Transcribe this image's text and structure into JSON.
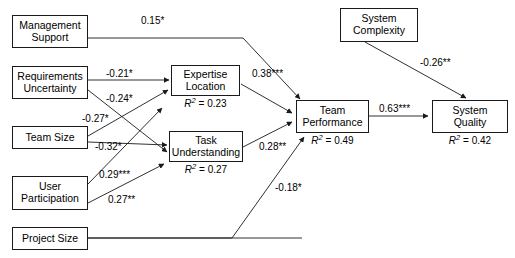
{
  "diagram": {
    "type": "path-diagram",
    "nodes": [
      {
        "id": "management_support",
        "label": "Management\nSupport",
        "r2": null
      },
      {
        "id": "requirements_uncertainty",
        "label": "Requirements\nUncertainty",
        "r2": null
      },
      {
        "id": "team_size",
        "label": "Team Size",
        "r2": null
      },
      {
        "id": "user_participation",
        "label": "User\nParticipation",
        "r2": null
      },
      {
        "id": "project_size",
        "label": "Project Size",
        "r2": null
      },
      {
        "id": "expertise_location",
        "label": "Expertise\nLocation",
        "r2": "0.23"
      },
      {
        "id": "task_understanding",
        "label": "Task\nUnderstanding",
        "r2": "0.27"
      },
      {
        "id": "team_performance",
        "label": "Team\nPerformance",
        "r2": "0.49"
      },
      {
        "id": "system_complexity",
        "label": "System\nComplexity",
        "r2": null
      },
      {
        "id": "system_quality",
        "label": "System\nQuality",
        "r2": "0.42"
      }
    ],
    "r2_prefix": "R",
    "r2_exponent": "2",
    "r2_equals": " = ",
    "edges": [
      {
        "id": "ms_tp",
        "from": "management_support",
        "to": "team_performance",
        "coefficient": "0.15*"
      },
      {
        "id": "ru_el",
        "from": "requirements_uncertainty",
        "to": "expertise_location",
        "coefficient": "-0.21*"
      },
      {
        "id": "ru_tu",
        "from": "requirements_uncertainty",
        "to": "task_understanding",
        "coefficient": "-0.24*"
      },
      {
        "id": "ts_el",
        "from": "team_size",
        "to": "expertise_location",
        "coefficient": "-0.27*"
      },
      {
        "id": "ts_tu",
        "from": "team_size",
        "to": "task_understanding",
        "coefficient": "-0.32*"
      },
      {
        "id": "up_el",
        "from": "user_participation",
        "to": "expertise_location",
        "coefficient": "0.29***"
      },
      {
        "id": "up_tu",
        "from": "user_participation",
        "to": "task_understanding",
        "coefficient": "0.27**"
      },
      {
        "id": "el_tp",
        "from": "expertise_location",
        "to": "team_performance",
        "coefficient": "0.38***"
      },
      {
        "id": "tu_tp",
        "from": "task_understanding",
        "to": "team_performance",
        "coefficient": "0.28**"
      },
      {
        "id": "ps_tp",
        "from": "project_size",
        "to": "team_performance",
        "coefficient": "-0.18*"
      },
      {
        "id": "tp_sq",
        "from": "team_performance",
        "to": "system_quality",
        "coefficient": "0.63***"
      },
      {
        "id": "sc_sq",
        "from": "system_complexity",
        "to": "system_quality",
        "coefficient": "-0.26**"
      }
    ],
    "colors": {
      "stroke": "#1a1a1a",
      "fill": "#ffffff",
      "text": "#000000"
    }
  }
}
